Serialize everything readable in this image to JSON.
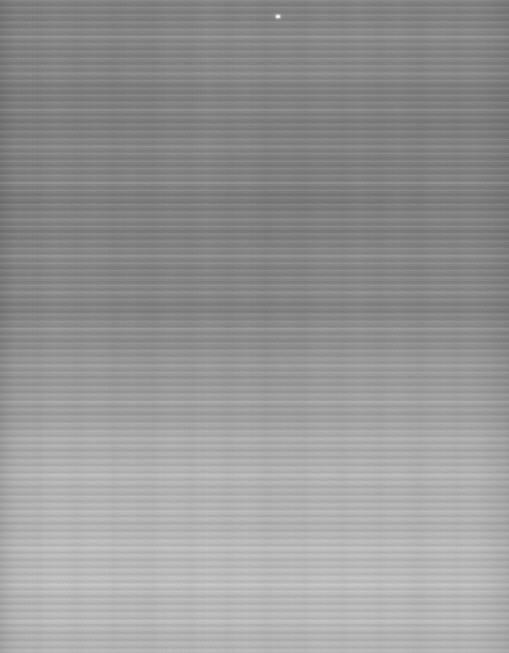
{
  "image": {
    "kind": "natural-image",
    "subject": "horizontally-striped gray surface texture",
    "description": "Full-frame grayscale photograph or scan of a finely corrugated / scanline-striped flat surface. No user-interface chrome, no text, no icons and no interactive controls are present anywhere in the frame.",
    "width_px": 509,
    "height_px": 653,
    "orientation": "portrait",
    "color_mode": "grayscale",
    "alt_text": "Grayscale texture of closely spaced horizontal stripes, darker at the top and gradually lightening toward the bottom."
  },
  "texture": {
    "pattern": "horizontal stripes",
    "stripe_orientation": "horizontal",
    "stripe_period_px": 7.3,
    "approx_stripe_count": 89,
    "secondary_band_period_px": 36.5,
    "slow_band_period_px": 102,
    "vertical_mottling": "faint vertical streaks overlaying the horizontal stripes",
    "edge_vignette": "slight darkening along the left and right margins and the top edge",
    "grain": "fine film/sensor grain across the whole frame"
  },
  "tonal_gradient": {
    "direction": "top to bottom",
    "description": "Luminance rises steadily from a mid-dark gray in the upper half to a light gray in the lower half; the transition is centered near y = 400 px.",
    "top_tone_hex": "#8a8a8a",
    "darkest_tone_hex": "#838383",
    "darkest_zone_y_px": 180,
    "midpoint_y_px": 400,
    "bottom_tone_hex": "#bfbfbf",
    "lightest_tone_hex": "#bfbfbf",
    "lightest_zone_y_px": 610,
    "contrast_note": "Stripe contrast is strongest in the dark upper region and softens toward the lighter bottom region."
  },
  "palette": {
    "base_gray": "#8d8d8d",
    "dark_stripe": "#7c7c7c",
    "light_stripe": "#9a9a9a",
    "upper_region": "#858585",
    "lower_region": "#bcbcbc",
    "speck_highlight": "#f2f2f2"
  },
  "artifacts": [
    {
      "name": "bright-speck",
      "type": "dust mote / sensor highlight",
      "x_px": 276,
      "y_px": 15,
      "width_px": 4,
      "height_px": 3,
      "color_hex": "#f2f2f2"
    }
  ]
}
